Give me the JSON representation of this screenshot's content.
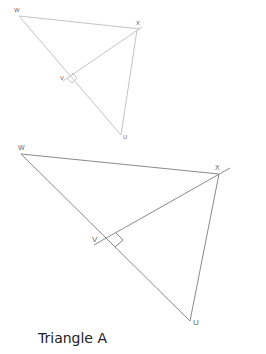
{
  "figure": {
    "caption": "Triangle A",
    "colors": {
      "small_triangle_stroke": "#c4c4c4",
      "large_triangle_stroke": "#8a8a8a",
      "label": "#666666",
      "background": "#ffffff"
    },
    "small_triangle": {
      "vertices": {
        "W": {
          "label": "W",
          "x": 19,
          "y": 15
        },
        "X": {
          "label": "X",
          "x": 137,
          "y": 30
        },
        "V": {
          "label": "V",
          "x": 68,
          "y": 77
        },
        "U": {
          "label": "U",
          "x": 121,
          "y": 136
        }
      },
      "right_angle_at": "V",
      "altitude": "XV perpendicular to WU"
    },
    "large_triangle": {
      "vertices": {
        "W": {
          "label": "W",
          "x": 21,
          "y": 153
        },
        "X": {
          "label": "X",
          "x": 218,
          "y": 174
        },
        "V": {
          "label": "V",
          "x": 111,
          "y": 238
        },
        "U": {
          "label": "U",
          "x": 190,
          "y": 321
        }
      },
      "right_angle_at": "V",
      "altitude": "XV perpendicular to WU"
    },
    "labels": {
      "small_W": "W",
      "small_X": "X",
      "small_V": "V",
      "small_U": "U",
      "large_W": "W",
      "large_X": "X",
      "large_V": "V",
      "large_U": "U"
    }
  }
}
